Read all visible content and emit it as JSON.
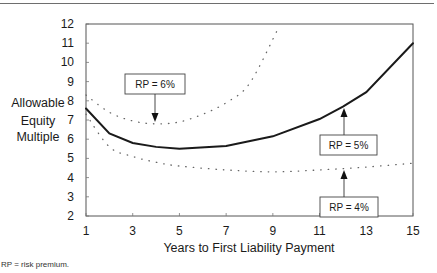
{
  "chart_data": {
    "type": "line",
    "title": "",
    "xlabel": "Years to First Liability Payment",
    "ylabel": "Allowable Equity Multiple",
    "ylabel_lines": [
      "Allowable",
      "Equity",
      "Multiple"
    ],
    "xlim": [
      1,
      15
    ],
    "ylim": [
      2,
      12
    ],
    "xticks": [
      1,
      3,
      5,
      7,
      9,
      11,
      13,
      15
    ],
    "yticks": [
      2,
      3,
      4,
      5,
      6,
      7,
      8,
      9,
      10,
      11,
      12
    ],
    "grid": false,
    "legend": "none (inline annotations)",
    "series": [
      {
        "name": "RP = 6%",
        "style": "dotted",
        "x": [
          1,
          2,
          3,
          4,
          5,
          6,
          7,
          8,
          9.2
        ],
        "values": [
          8.3,
          7.4,
          6.95,
          6.8,
          6.9,
          7.3,
          7.9,
          8.9,
          11.7
        ]
      },
      {
        "name": "RP = 5%",
        "style": "solid",
        "x": [
          1,
          2,
          3,
          4,
          5,
          7,
          9,
          11,
          12,
          13,
          15
        ],
        "values": [
          7.6,
          6.3,
          5.8,
          5.6,
          5.5,
          5.65,
          6.15,
          7.05,
          7.7,
          8.45,
          11.0
        ]
      },
      {
        "name": "RP = 4%",
        "style": "dotted",
        "x": [
          1,
          2,
          3,
          4,
          5,
          7,
          9,
          11,
          13,
          15
        ],
        "values": [
          7.3,
          5.6,
          5.1,
          4.8,
          4.6,
          4.4,
          4.3,
          4.4,
          4.55,
          4.75
        ]
      }
    ],
    "annotations": [
      {
        "text": "RP = 6%",
        "series": "RP = 6%",
        "arrow_to_x": 3.9
      },
      {
        "text": "RP = 5%",
        "series": "RP = 5%",
        "arrow_to_x": 12
      },
      {
        "text": "RP = 4%",
        "series": "RP = 4%",
        "arrow_to_x": 12
      }
    ]
  },
  "footnote": "RP = risk premium."
}
